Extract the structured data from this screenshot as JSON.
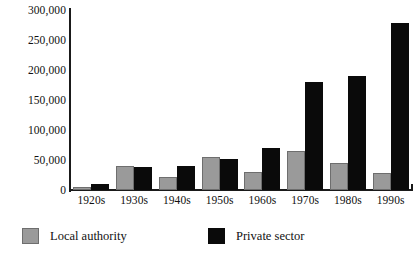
{
  "chart_data": {
    "type": "bar",
    "title": "",
    "xlabel": "",
    "ylabel": "",
    "ylim": [
      0,
      300000
    ],
    "grid": false,
    "legend_position": "bottom-left",
    "categories": [
      "1920s",
      "1930s",
      "1940s",
      "1950s",
      "1960s",
      "1970s",
      "1980s",
      "1990s"
    ],
    "ytick_labels": [
      "300,000",
      "250,000",
      "200,000",
      "150,000",
      "100,000",
      "50,000",
      "0"
    ],
    "ytick_values": [
      300000,
      250000,
      200000,
      150000,
      100000,
      50000,
      0
    ],
    "series": [
      {
        "name": "Local authority",
        "color": "#9a9a9a",
        "values": [
          5000,
          40000,
          22000,
          55000,
          30000,
          65000,
          45000,
          28000
        ]
      },
      {
        "name": "Private sector",
        "color": "#0a0a0a",
        "values": [
          10000,
          38000,
          40000,
          52000,
          70000,
          180000,
          190000,
          278000
        ]
      }
    ]
  }
}
